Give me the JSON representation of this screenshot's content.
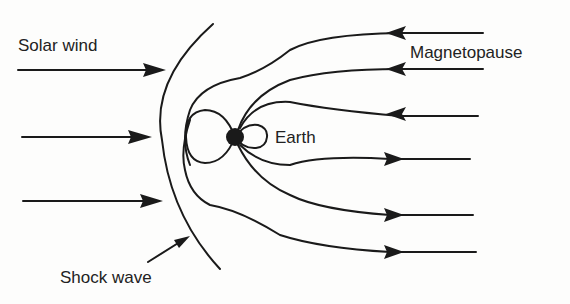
{
  "diagram": {
    "labels": {
      "solar_wind": "Solar wind",
      "magnetopause": "Magnetopause",
      "earth": "Earth",
      "shock_wave": "Shock wave"
    },
    "colors": {
      "ink": "#1a1a1a",
      "background": "#fdfdfc"
    },
    "solar_wind_arrows": [
      {
        "x1": 18,
        "y": 70,
        "x2": 166
      },
      {
        "x1": 22,
        "y": 137,
        "x2": 152
      },
      {
        "x1": 23,
        "y": 201,
        "x2": 163
      }
    ],
    "field_lines_tail": [
      {
        "direction": "toward-earth",
        "end_y": 33
      },
      {
        "direction": "toward-earth",
        "end_y": 69
      },
      {
        "direction": "toward-earth",
        "end_y": 116
      },
      {
        "direction": "away-from-earth",
        "end_y": 159
      },
      {
        "direction": "away-from-earth",
        "end_y": 215
      },
      {
        "direction": "away-from-earth",
        "end_y": 252
      }
    ]
  }
}
